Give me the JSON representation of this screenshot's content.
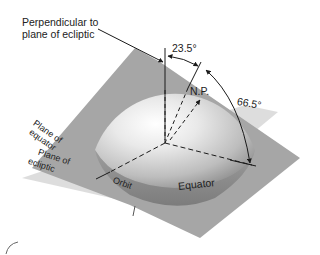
{
  "diagram": {
    "type": "earth-tilt-axes",
    "labels": {
      "perpendicular_line1": "Perpendicular to",
      "perpendicular_line2": "plane of ecliptic",
      "angle_small": "23.5°",
      "angle_large": "66.5°",
      "north_pole": "N.P.",
      "plane_equator_line1": "Plane of",
      "plane_equator_line2": "equator",
      "plane_ecliptic_line1": "Plane of",
      "plane_ecliptic_line2": "ecliptic",
      "orbit": "Orbit",
      "equator": "Equator"
    },
    "colors": {
      "equator_plane": "#a9a9a9",
      "ecliptic_plane": "#d6d6d6",
      "sphere_light": "#f4f4f4",
      "sphere_dark": "#8a8a8a",
      "line": "#1a1a1a"
    }
  }
}
